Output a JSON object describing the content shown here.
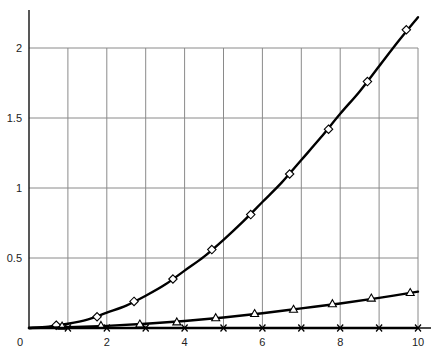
{
  "chart_data": {
    "type": "line",
    "title": "",
    "xlabel": "",
    "ylabel": "",
    "xlim": [
      0,
      10
    ],
    "ylim": [
      0,
      2.2
    ],
    "grid": true,
    "legend": null,
    "x_ticks": [
      0,
      2,
      4,
      6,
      8,
      10
    ],
    "x_tick_labels": [
      "0",
      "2",
      "4",
      "6",
      "8",
      "10"
    ],
    "x_gridlines": [
      1,
      2,
      3,
      4,
      5,
      6,
      7,
      8,
      9,
      10
    ],
    "y_ticks": [
      0.5,
      1,
      1.5,
      2
    ],
    "y_tick_labels": [
      "0.5",
      "1",
      "1.5",
      "2"
    ],
    "series": [
      {
        "name": "diamond series",
        "marker": "diamond",
        "points": [
          {
            "x": 0.7,
            "y": 0.02
          },
          {
            "x": 1.75,
            "y": 0.08
          },
          {
            "x": 2.7,
            "y": 0.19
          },
          {
            "x": 3.7,
            "y": 0.35
          },
          {
            "x": 4.7,
            "y": 0.56
          },
          {
            "x": 5.7,
            "y": 0.81
          },
          {
            "x": 6.7,
            "y": 1.1
          },
          {
            "x": 7.7,
            "y": 1.42
          },
          {
            "x": 8.7,
            "y": 1.76
          },
          {
            "x": 9.7,
            "y": 2.13
          }
        ],
        "curve": [
          {
            "x": 0,
            "y": 0.0
          },
          {
            "x": 0.5,
            "y": 0.01
          },
          {
            "x": 1,
            "y": 0.03
          },
          {
            "x": 1.5,
            "y": 0.06
          },
          {
            "x": 2,
            "y": 0.11
          },
          {
            "x": 2.5,
            "y": 0.16
          },
          {
            "x": 3,
            "y": 0.23
          },
          {
            "x": 3.5,
            "y": 0.31
          },
          {
            "x": 4,
            "y": 0.41
          },
          {
            "x": 4.5,
            "y": 0.51
          },
          {
            "x": 5,
            "y": 0.63
          },
          {
            "x": 5.5,
            "y": 0.76
          },
          {
            "x": 6,
            "y": 0.9
          },
          {
            "x": 6.5,
            "y": 1.04
          },
          {
            "x": 7,
            "y": 1.2
          },
          {
            "x": 7.5,
            "y": 1.36
          },
          {
            "x": 8,
            "y": 1.53
          },
          {
            "x": 8.5,
            "y": 1.69
          },
          {
            "x": 9,
            "y": 1.87
          },
          {
            "x": 9.5,
            "y": 2.05
          },
          {
            "x": 10,
            "y": 2.22
          }
        ]
      },
      {
        "name": "triangle series",
        "marker": "triangle",
        "points": [
          {
            "x": 0.85,
            "y": 0.01
          },
          {
            "x": 1.85,
            "y": 0.015
          },
          {
            "x": 2.85,
            "y": 0.025
          },
          {
            "x": 3.8,
            "y": 0.04
          },
          {
            "x": 4.8,
            "y": 0.07
          },
          {
            "x": 5.8,
            "y": 0.1
          },
          {
            "x": 6.8,
            "y": 0.13
          },
          {
            "x": 7.8,
            "y": 0.17
          },
          {
            "x": 8.8,
            "y": 0.21
          },
          {
            "x": 9.8,
            "y": 0.25
          }
        ],
        "curve": [
          {
            "x": 0,
            "y": 0.0
          },
          {
            "x": 1,
            "y": 0.005
          },
          {
            "x": 2,
            "y": 0.015
          },
          {
            "x": 3,
            "y": 0.03
          },
          {
            "x": 4,
            "y": 0.05
          },
          {
            "x": 5,
            "y": 0.075
          },
          {
            "x": 6,
            "y": 0.105
          },
          {
            "x": 7,
            "y": 0.14
          },
          {
            "x": 8,
            "y": 0.175
          },
          {
            "x": 9,
            "y": 0.215
          },
          {
            "x": 10,
            "y": 0.26
          }
        ]
      },
      {
        "name": "cross series",
        "marker": "cross",
        "points": [
          {
            "x": 1,
            "y": 0.0
          },
          {
            "x": 2,
            "y": 0.0
          },
          {
            "x": 3,
            "y": 0.0
          },
          {
            "x": 4,
            "y": 0.0
          },
          {
            "x": 5,
            "y": 0.0
          },
          {
            "x": 6,
            "y": 0.0
          },
          {
            "x": 7,
            "y": 0.0
          },
          {
            "x": 8,
            "y": 0.0
          },
          {
            "x": 9,
            "y": 0.0
          },
          {
            "x": 10,
            "y": 0.0
          }
        ],
        "curve": [
          {
            "x": 0,
            "y": 0.0
          },
          {
            "x": 10,
            "y": 0.0
          }
        ]
      }
    ]
  },
  "layout": {
    "plot_left": 29,
    "plot_right": 418,
    "plot_bottom": 328,
    "y_per_unit": 140,
    "grid_top": 48,
    "axis_top": 10,
    "axis_right": 431
  }
}
